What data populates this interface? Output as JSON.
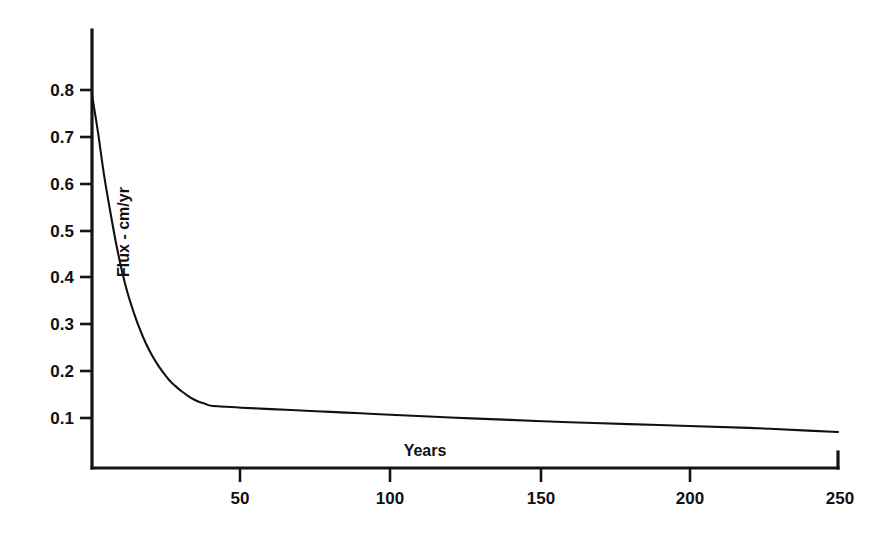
{
  "figure": {
    "background_color": "#ffffff",
    "ink_color": "#111111"
  },
  "chart_data": {
    "type": "line",
    "title": "",
    "subtitle": "",
    "xlabel": "Years",
    "ylabel": "Flux - cm/yr",
    "xlim": [
      0,
      250
    ],
    "ylim": [
      0,
      0.85
    ],
    "grid": false,
    "legend": null,
    "legend_position": "none",
    "xticks": [
      50,
      100,
      150,
      200,
      250
    ],
    "xtick_labels": [
      "50",
      "100",
      "150",
      "200",
      "250"
    ],
    "yticks": [
      0.1,
      0.2,
      0.3,
      0.4,
      0.5,
      0.6,
      0.7,
      0.8
    ],
    "ytick_labels": [
      "0.1",
      "0.2",
      "0.3",
      "0.4",
      "0.5",
      "0.6",
      "0.7",
      "0.8"
    ],
    "series": [
      {
        "name": "Flux",
        "color": "#111111",
        "x": [
          0,
          2,
          4,
          6,
          8,
          10,
          12,
          14,
          16,
          18,
          20,
          22,
          24,
          26,
          28,
          30,
          32,
          34,
          36,
          38,
          40,
          45,
          50,
          60,
          70,
          80,
          90,
          100,
          120,
          140,
          160,
          180,
          200,
          220,
          240,
          250
        ],
        "y": [
          0.79,
          0.71,
          0.62,
          0.545,
          0.475,
          0.415,
          0.365,
          0.325,
          0.29,
          0.26,
          0.235,
          0.214,
          0.196,
          0.18,
          0.168,
          0.157,
          0.148,
          0.14,
          0.134,
          0.13,
          0.126,
          0.124,
          0.122,
          0.119,
          0.116,
          0.113,
          0.11,
          0.107,
          0.101,
          0.096,
          0.091,
          0.087,
          0.083,
          0.079,
          0.073,
          0.07
        ]
      }
    ],
    "annotations": []
  },
  "axes_labels": {
    "x_axis_title": "Years",
    "y_axis_title": "Flux - cm/yr"
  }
}
